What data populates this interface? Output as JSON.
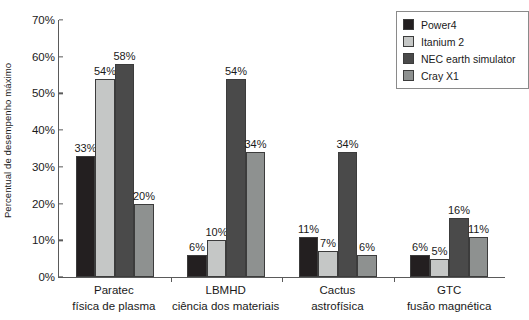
{
  "chart_data": {
    "type": "bar",
    "title": "",
    "xlabel": "",
    "ylabel": "Percentual de desempenho máximo",
    "ylim": [
      0,
      70
    ],
    "ytick_labels": [
      "0%",
      "10%",
      "20%",
      "30%",
      "40%",
      "50%",
      "60%",
      "70%"
    ],
    "ytick_values": [
      0,
      10,
      20,
      30,
      40,
      50,
      60,
      70
    ],
    "grid": false,
    "legend_position": "top-right",
    "categories": [
      "Paratec",
      "LBMHD",
      "Cactus",
      "GTC"
    ],
    "category_sublabels": [
      "física de plasma",
      "ciência dos materiais",
      "astrofísica",
      "fusão magnética"
    ],
    "series": [
      {
        "name": "Power4",
        "color": "#231f20",
        "values": [
          33,
          6,
          11,
          6
        ],
        "labels": [
          "33%",
          "6%",
          "11%",
          "6%"
        ]
      },
      {
        "name": "Itanium 2",
        "color": "#c5c7c6",
        "values": [
          54,
          10,
          7,
          5
        ],
        "labels": [
          "54%",
          "10%",
          "7%",
          "5%"
        ]
      },
      {
        "name": "NEC earth simulator",
        "color": "#4a4a4a",
        "values": [
          58,
          54,
          34,
          16
        ],
        "labels": [
          "58%",
          "54%",
          "34%",
          "16%"
        ]
      },
      {
        "name": "Cray X1",
        "color": "#8e9190",
        "values": [
          20,
          34,
          6,
          11
        ],
        "labels": [
          "20%",
          "34%",
          "6%",
          "11%"
        ]
      }
    ]
  },
  "legend": {
    "items": [
      {
        "label": "Power4"
      },
      {
        "label": "Itanium 2"
      },
      {
        "label": "NEC earth simulator"
      },
      {
        "label": "Cray X1"
      }
    ]
  }
}
